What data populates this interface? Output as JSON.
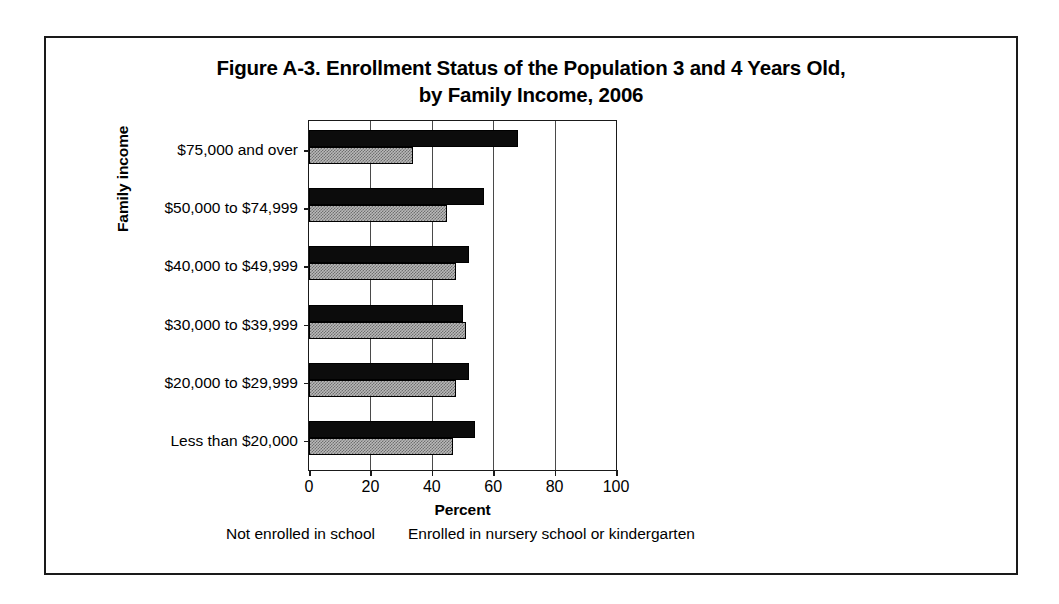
{
  "figure": {
    "title_line_1": "Figure A-3. Enrollment Status of the Population 3 and 4 Years Old,",
    "title_line_2": "by Family Income, 2006"
  },
  "chart_data": {
    "type": "bar",
    "orientation": "horizontal",
    "title": "Figure A-3. Enrollment Status of the Population 3 and 4 Years Old, by Family Income, 2006",
    "xlabel": "Percent",
    "ylabel": "Family income",
    "xlim": [
      0,
      100
    ],
    "xticks": [
      0,
      20,
      40,
      60,
      80,
      100
    ],
    "xtick_labels": [
      "0",
      "20",
      "40",
      "60",
      "80",
      "100"
    ],
    "grid": "vertical",
    "legend_position": "below",
    "categories": [
      "$75,000 and over",
      "$50,000 to $74,999",
      "$40,000 to $49,999",
      "$30,000 to $39,999",
      "$20,000 to $29,999",
      "Less than $20,000"
    ],
    "series": [
      {
        "name": "Enrolled in nursery school or kindergarten",
        "style": "solid-black",
        "color": "#0c0c0c",
        "values": [
          68,
          57,
          52,
          50,
          52,
          54
        ]
      },
      {
        "name": "Not enrolled in school",
        "style": "stippled-gray",
        "color": "#b9b9b9",
        "values": [
          34,
          45,
          48,
          51,
          48,
          47
        ]
      }
    ]
  },
  "legend": {
    "entries": [
      "Not enrolled in school",
      "Enrolled in nursery school or kindergarten"
    ]
  }
}
